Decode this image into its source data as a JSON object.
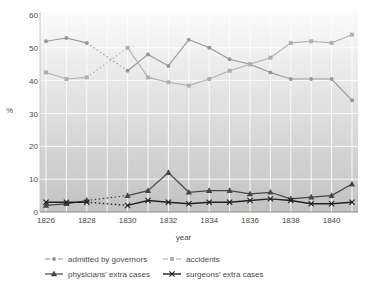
{
  "chart_data": {
    "type": "line",
    "title": "",
    "xlabel": "year",
    "ylabel": "%",
    "x": [
      1826,
      1827,
      1828,
      1829,
      1830,
      1831,
      1832,
      1833,
      1834,
      1835,
      1836,
      1837,
      1838,
      1839,
      1840,
      1841
    ],
    "x_tick_years": [
      1826,
      1828,
      1830,
      1832,
      1834,
      1836,
      1838,
      1840
    ],
    "x_tick_labels": [
      "1826",
      "1828",
      "1830",
      "1832",
      "1834",
      "1836",
      "1838",
      "1840"
    ],
    "y_ticks": [
      0,
      10,
      20,
      30,
      40,
      50,
      60
    ],
    "y_tick_labels": [
      "0",
      "10",
      "20",
      "30",
      "40",
      "50",
      "60"
    ],
    "ylim": [
      0,
      60
    ],
    "xlim": [
      1825.7,
      1841.3
    ],
    "gap_years": [
      1829
    ],
    "gap_style": "dotted",
    "grid": "on",
    "gridline_color": "#ffffff",
    "plot_bg_top": "#fbfbfb",
    "plot_bg_bottom": "#c2c2c2",
    "axis_line_color": "#8a8a8a",
    "legend_position": "bottom",
    "series": [
      {
        "name": "admitted by governors",
        "marker": "circle",
        "color": "#979797",
        "values": [
          52,
          53,
          51.5,
          null,
          43,
          48,
          44.5,
          52.5,
          50,
          46.5,
          45,
          42.5,
          40.5,
          40.5,
          40.5,
          34
        ]
      },
      {
        "name": "accidents",
        "marker": "square",
        "color": "#b0b0b0",
        "values": [
          42.5,
          40.5,
          41,
          null,
          50,
          41,
          39.5,
          38.5,
          40.5,
          43,
          45,
          47,
          51.5,
          52,
          51.5,
          54
        ]
      },
      {
        "name": "physicians' extra cases",
        "marker": "triangle",
        "color": "#474747",
        "values": [
          2,
          2.5,
          3.5,
          null,
          5,
          6.5,
          12,
          6,
          6.5,
          6.5,
          5.5,
          6,
          4,
          4.5,
          5,
          8.5
        ]
      },
      {
        "name": "surgeons' extra cases",
        "marker": "x",
        "color": "#222222",
        "values": [
          3,
          3,
          3,
          null,
          2,
          3.5,
          3,
          2.5,
          3,
          3,
          3.5,
          4,
          3.5,
          2.5,
          2.5,
          3
        ]
      }
    ]
  }
}
